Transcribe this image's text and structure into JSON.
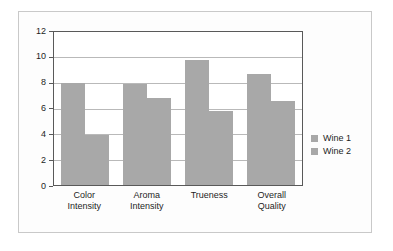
{
  "chart_data": {
    "type": "bar",
    "title": "",
    "xlabel": "",
    "ylabel": "",
    "ylim": [
      0,
      12
    ],
    "yticks": [
      "0",
      "2",
      "4",
      "6",
      "8",
      "10",
      "12"
    ],
    "grid": true,
    "legend_position": "right",
    "categories": [
      "Color Intensity",
      "Aroma Intensity",
      "Trueness",
      "Overall Quality"
    ],
    "category_lines": [
      [
        "Color",
        "Intensity"
      ],
      [
        "Aroma",
        "Intensity"
      ],
      [
        "Trueness",
        ""
      ],
      [
        "Overall",
        "Quality"
      ]
    ],
    "series": [
      {
        "name": "Wine 1",
        "color": "#a8a8a8",
        "values": [
          8.0,
          7.9,
          9.8,
          8.7
        ]
      },
      {
        "name": "Wine 2",
        "color": "#a8a8a8",
        "values": [
          3.9,
          6.8,
          5.8,
          6.6
        ]
      }
    ]
  },
  "colors": {
    "bar_fill": "#a8a8a8",
    "axis_line": "#595959",
    "gridline": "#b9b9b9",
    "frame": "#c9c9c9",
    "text": "#1d1d1d"
  }
}
